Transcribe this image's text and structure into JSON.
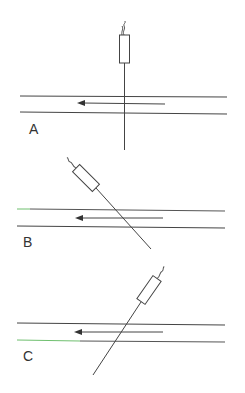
{
  "figure": {
    "colors": {
      "line": "#444444",
      "background": "#ffffff",
      "accent_green": "#6fbf6f",
      "accent_purple": "#8a6a8a"
    },
    "panels": [
      {
        "label": "A",
        "orientation": "perpendicular",
        "flow_direction": "leftward"
      },
      {
        "label": "B",
        "orientation": "angled toward flow (probe tip pointing downstream-right)",
        "flow_direction": "leftward"
      },
      {
        "label": "C",
        "orientation": "angled against flow (probe tip pointing downstream-left)",
        "flow_direction": "leftward"
      }
    ]
  }
}
